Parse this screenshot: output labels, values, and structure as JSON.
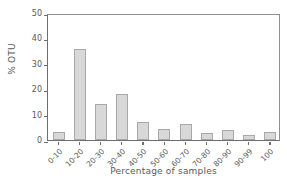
{
  "chart_data": {
    "type": "bar",
    "title": "",
    "xlabel": "Percentage of samples",
    "ylabel": "% OTU",
    "categories": [
      "0-10",
      "10-20",
      "20-30",
      "30-40",
      "40-50",
      "50-60",
      "60-70",
      "70-80",
      "80-90",
      "90-99",
      "100"
    ],
    "values": [
      3.0,
      36.0,
      14.2,
      18.0,
      7.0,
      4.5,
      6.3,
      2.7,
      3.8,
      1.8,
      3.2
    ],
    "ylim": [
      0,
      50
    ],
    "yticks": [
      0,
      10,
      20,
      30,
      40,
      50
    ],
    "ytick_labels": [
      "0",
      "10",
      "20",
      "30",
      "40",
      "50"
    ],
    "grid": false,
    "legend": null,
    "bar_color": "#d8d8d8",
    "bar_edge_color": "#a8a8a8",
    "axis_color": "#6e6e6e",
    "text_color": "#595959",
    "background": "#ffffff"
  }
}
